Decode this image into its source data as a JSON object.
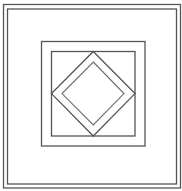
{
  "figure": {
    "type": "quilt-block-line-drawing",
    "colors": {
      "background": "#ffffff",
      "line": "#555555"
    },
    "elements": [
      "outer-border",
      "inner-border",
      "middle-square",
      "inner-square",
      "outer-diamond",
      "inner-diamond"
    ]
  }
}
